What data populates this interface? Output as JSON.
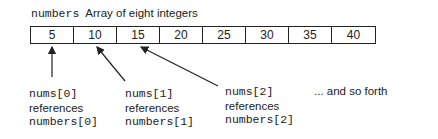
{
  "title": {
    "variable": "numbers",
    "description": "Array of eight integers"
  },
  "array": {
    "values": [
      "5",
      "10",
      "15",
      "20",
      "25",
      "30",
      "35",
      "40"
    ]
  },
  "references": [
    {
      "ref": "nums[0]",
      "verb": "references",
      "target": "numbers[0]"
    },
    {
      "ref": "nums[1]",
      "verb": "references",
      "target": "numbers[1]"
    },
    {
      "ref": "nums[2]",
      "verb": "references",
      "target": "numbers[2]"
    }
  ],
  "continuation": "... and so forth",
  "colors": {
    "ink": "#222222",
    "background": "#ffffff"
  }
}
